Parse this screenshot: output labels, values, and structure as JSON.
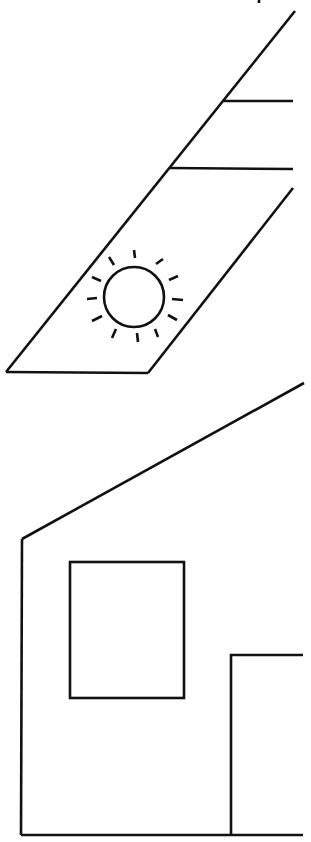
{
  "illustration": {
    "description": "Line drawing of a solar panel above a house outline",
    "stroke_color": "#111111",
    "background_color": "#ffffff",
    "stroke_width": 2.6,
    "top_mark": {
      "x1": 259,
      "y1": 0,
      "x2": 259,
      "y2": 3
    },
    "solar_panel": {
      "outer_diagonal": {
        "x1": 295,
        "y1": 11,
        "x2": 6,
        "y2": 372
      },
      "inner_diagonal": {
        "x1": 293,
        "y1": 188,
        "x2": 148,
        "y2": 373
      },
      "bottom_edge": {
        "x1": 6,
        "y1": 372,
        "x2": 148,
        "y2": 373
      },
      "rail_upper": {
        "x1": 224,
        "y1": 101,
        "x2": 293,
        "y2": 101
      },
      "rail_lower": {
        "x1": 170,
        "y1": 168,
        "x2": 293,
        "y2": 169
      }
    },
    "sun_icon": {
      "cx": 134,
      "cy": 297,
      "r": 30,
      "rays": [
        {
          "x1": 134,
          "y1": 250,
          "x2": 135,
          "y2": 258
        },
        {
          "x1": 109,
          "y1": 257,
          "x2": 114,
          "y2": 265
        },
        {
          "x1": 156,
          "y1": 264,
          "x2": 163,
          "y2": 259
        },
        {
          "x1": 92,
          "y1": 277,
          "x2": 101,
          "y2": 281
        },
        {
          "x1": 169,
          "y1": 280,
          "x2": 178,
          "y2": 276
        },
        {
          "x1": 87,
          "y1": 299,
          "x2": 97,
          "y2": 298
        },
        {
          "x1": 172,
          "y1": 299,
          "x2": 183,
          "y2": 300
        },
        {
          "x1": 92,
          "y1": 321,
          "x2": 102,
          "y2": 316
        },
        {
          "x1": 168,
          "y1": 315,
          "x2": 177,
          "y2": 320
        },
        {
          "x1": 112,
          "y1": 338,
          "x2": 116,
          "y2": 329
        },
        {
          "x1": 137,
          "y1": 333,
          "x2": 138,
          "y2": 342
        },
        {
          "x1": 155,
          "y1": 329,
          "x2": 158,
          "y2": 337
        }
      ]
    },
    "house": {
      "roof_line": {
        "x1": 304,
        "y1": 383,
        "x2": 22,
        "y2": 539
      },
      "left_wall": {
        "x1": 22,
        "y1": 539,
        "x2": 21,
        "y2": 835
      },
      "ground_line": {
        "x1": 21,
        "y1": 835,
        "x2": 303,
        "y2": 835
      },
      "window": {
        "x": 70,
        "y": 562,
        "width": 114,
        "height": 136
      },
      "door": {
        "left_x": 231,
        "top_y": 655,
        "right_x": 303,
        "bottom_y": 835
      }
    }
  }
}
